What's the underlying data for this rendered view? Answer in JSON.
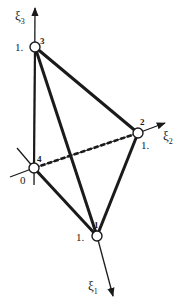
{
  "diagram": {
    "type": "tetrahedral-element-natural-coordinates",
    "colors": {
      "stroke": "#1a1a1a",
      "node_fill": "#ffffff",
      "background": "#ffffff"
    },
    "nodes": [
      {
        "id": "1",
        "label": "1",
        "coord_label": "1.",
        "x": 97,
        "y": 236
      },
      {
        "id": "2",
        "label": "2",
        "coord_label": "1.",
        "x": 138,
        "y": 133
      },
      {
        "id": "3",
        "label": "3",
        "coord_label": "1.",
        "x": 35,
        "y": 47
      },
      {
        "id": "4",
        "label": "4",
        "coord_label": "0",
        "x": 34,
        "y": 168
      }
    ],
    "edges": [
      {
        "from": "3",
        "to": "2",
        "style": "solid"
      },
      {
        "from": "3",
        "to": "1",
        "style": "solid"
      },
      {
        "from": "3",
        "to": "4",
        "style": "solid"
      },
      {
        "from": "2",
        "to": "1",
        "style": "solid"
      },
      {
        "from": "4",
        "to": "1",
        "style": "solid"
      },
      {
        "from": "4",
        "to": "2",
        "style": "dashed"
      }
    ],
    "axes": [
      {
        "name": "xi1",
        "symbol": "ξ",
        "subscript": "1"
      },
      {
        "name": "xi2",
        "symbol": "ξ",
        "subscript": "2"
      },
      {
        "name": "xi3",
        "symbol": "ξ",
        "subscript": "3"
      }
    ]
  }
}
